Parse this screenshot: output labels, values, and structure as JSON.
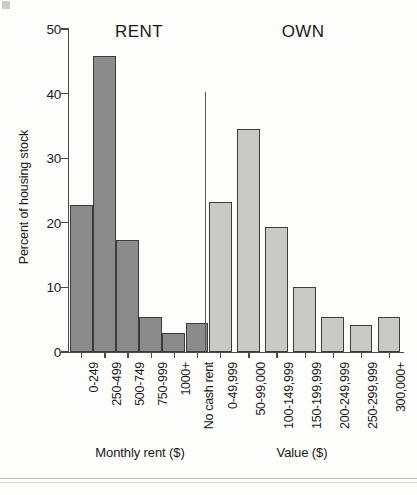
{
  "chart_data": {
    "type": "bar",
    "title": "",
    "xlabel": "",
    "ylabel": "Percent of housing stock",
    "ylim": [
      0,
      50
    ],
    "yticks": [
      0,
      10,
      20,
      30,
      40,
      50
    ],
    "ytick_labels": [
      "0",
      "10",
      "20",
      "30",
      "40",
      "50"
    ],
    "grid": false,
    "legend": "none",
    "groups": [
      {
        "name": "RENT",
        "heading": "RENT",
        "caption": "Monthly rent ($)",
        "bar_color": "#8b8b8b",
        "categories": [
          "0-249",
          "250-499",
          "500-749",
          "750-999",
          "1000+",
          "No cash rent"
        ],
        "values": [
          22.8,
          45.8,
          17.4,
          5.4,
          2.9,
          4.5
        ]
      },
      {
        "name": "OWN",
        "heading": "OWN",
        "caption": "Value ($)",
        "bar_color": "#c9c9c7",
        "categories": [
          "0-49,999",
          "50-99,000",
          "100-149,999",
          "150-199,999",
          "200-249,999",
          "250-299,999",
          "300,000+"
        ],
        "values": [
          23.2,
          34.5,
          19.3,
          10.1,
          5.4,
          4.2,
          5.4
        ]
      }
    ]
  },
  "axis": {
    "y_title": "Percent of housing stock",
    "y_ticks": [
      "50",
      "40",
      "30",
      "20",
      "10",
      "0"
    ]
  },
  "headings": {
    "rent": "RENT",
    "own": "OWN"
  },
  "captions": {
    "rent": "Monthly rent ($)",
    "own": "Value ($)"
  },
  "colors": {
    "rent_bar": "#8b8b8b",
    "own_bar": "#c9c9c7",
    "bar_outline": "#3c3c3c",
    "axis": "#4a4a4a",
    "background": "#fdfdfc"
  }
}
